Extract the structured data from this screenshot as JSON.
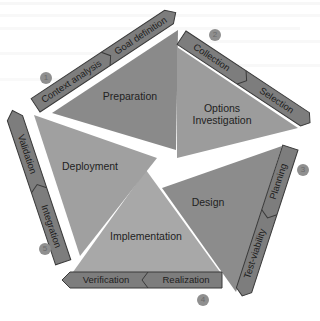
{
  "diagram": {
    "type": "pentagon-cycle",
    "colors": {
      "background": "#ffffff",
      "band_fill": "#7d7d7d",
      "band_stroke": "#3a3a3a",
      "badge_fill": "#8f8f8f",
      "triangle_fills": [
        "#8a8a8a",
        "#9c9c9c",
        "#8c8c8c",
        "#a8a8a8",
        "#a0a0a0"
      ]
    },
    "phases": [
      {
        "number": "1",
        "title": "Preparation",
        "steps": [
          "Context analysis",
          "Goal definition"
        ]
      },
      {
        "number": "2",
        "title_line1": "Options",
        "title_line2": "Investigation",
        "steps": [
          "Collection",
          "Selection"
        ]
      },
      {
        "number": "3",
        "title": "Design",
        "steps": [
          "Planning",
          "Test-viability"
        ]
      },
      {
        "number": "4",
        "title": "Implementation",
        "steps": [
          "Realization",
          "Verification"
        ]
      },
      {
        "number": "5",
        "title": "Deployment",
        "steps": [
          "Integration",
          "Validation"
        ]
      }
    ]
  }
}
